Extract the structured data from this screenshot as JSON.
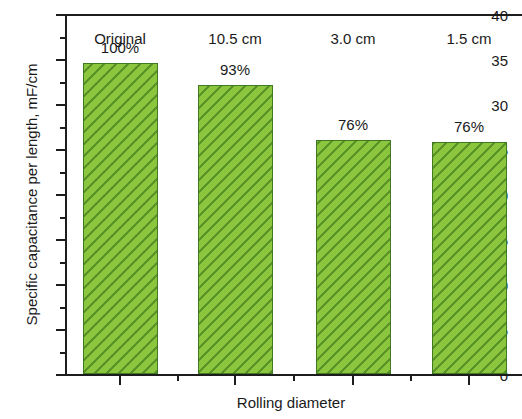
{
  "chart_data": {
    "type": "bar",
    "title": "",
    "xlabel": "Rolling diameter",
    "ylabel": "Specific capacitance per length, mF/cm",
    "categories": [
      "Original",
      "10.5 cm",
      "3.0 cm",
      "1.5 cm"
    ],
    "values": [
      34.6,
      32.1,
      26.0,
      25.8
    ],
    "data_labels": [
      "100%",
      "93%",
      "76%",
      "76%"
    ],
    "ylim": [
      0,
      40
    ],
    "ytick_labels": [
      "0",
      "5",
      "10",
      "15",
      "20",
      "25",
      "30",
      "35",
      "40"
    ],
    "ytick_values": [
      0,
      5,
      10,
      15,
      20,
      25,
      30,
      35,
      40
    ],
    "yminor_values": [
      2.5,
      7.5,
      12.5,
      17.5,
      22.5,
      27.5,
      32.5,
      37.5
    ],
    "grid": false,
    "legend": null,
    "bar_color": "#8cc63f",
    "bar_hatch_color": "#46821e",
    "bar_edge_color": "#3f7a22",
    "axis_color": "#1d1d1d",
    "hatch_pattern": "backward-diagonal"
  }
}
